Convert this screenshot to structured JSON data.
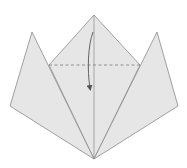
{
  "diagram": {
    "type": "origami-fold-step",
    "colors": {
      "paper_fill": "#e6e6e6",
      "edge_stroke": "#8a8a8a",
      "fold_line": "#7a7a7a",
      "arrow": "#555555",
      "background": "#ffffff"
    },
    "shapes": {
      "center_kite": {
        "points": [
          [
            94,
            15
          ],
          [
            140,
            65
          ],
          [
            94,
            159
          ],
          [
            49,
            65
          ]
        ]
      },
      "left_flap": {
        "points": [
          [
            32,
            32
          ],
          [
            94,
            159
          ],
          [
            10,
            106
          ]
        ]
      },
      "right_flap": {
        "points": [
          [
            157,
            32
          ],
          [
            178,
            106
          ],
          [
            94,
            159
          ]
        ]
      },
      "center_crease": {
        "from": [
          94,
          15
        ],
        "to": [
          94,
          159
        ]
      },
      "valley_fold_line": {
        "from": [
          49,
          65
        ],
        "to": [
          140,
          65
        ],
        "style": "dashed"
      },
      "fold_arrow": {
        "from": [
          93,
          32
        ],
        "to": [
          90,
          90
        ],
        "direction": "down"
      }
    }
  }
}
